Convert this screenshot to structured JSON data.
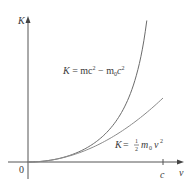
{
  "chart_data": {
    "type": "line",
    "title": "",
    "xlabel": "v",
    "ylabel": "K",
    "x_ticks": [
      {
        "value": 1.0,
        "label": "c"
      }
    ],
    "origin_label": "0",
    "xlim": [
      0,
      1.1
    ],
    "ylim": [
      0,
      1.1
    ],
    "grid": false,
    "legend": "none (curves labeled inline)",
    "x_units": "fraction of c",
    "y_units": "m0c^2",
    "series": [
      {
        "name": "relativistic",
        "label": "K = mc² − m₀c²",
        "x": [
          0,
          0.1,
          0.2,
          0.3,
          0.4,
          0.5,
          0.6,
          0.7,
          0.8,
          0.85,
          0.88
        ],
        "y": [
          0,
          0.005,
          0.021,
          0.048,
          0.091,
          0.155,
          0.25,
          0.4,
          0.667,
          0.898,
          1.105
        ]
      },
      {
        "name": "classical",
        "label": "K = ½ m₀v²",
        "x": [
          0,
          0.1,
          0.2,
          0.3,
          0.4,
          0.5,
          0.6,
          0.7,
          0.8,
          0.9,
          1.0
        ],
        "y": [
          0,
          0.005,
          0.02,
          0.045,
          0.08,
          0.125,
          0.18,
          0.245,
          0.32,
          0.405,
          0.5
        ]
      }
    ]
  },
  "labels": {
    "y_axis": "K",
    "x_axis": "v",
    "origin": "0",
    "c_tick": "c",
    "relativistic_K": "K",
    "relativistic_eq": " = mc",
    "relativistic_sup1": "2",
    "relativistic_minus": " − m",
    "relativistic_sub": "0",
    "relativistic_c": "c",
    "relativistic_sup2": "2",
    "classical_K": "K",
    "classical_eq": " = ",
    "classical_num": "1",
    "classical_den": "2",
    "classical_m": "m",
    "classical_sub": "0",
    "classical_v": "v",
    "classical_sup": "2"
  }
}
